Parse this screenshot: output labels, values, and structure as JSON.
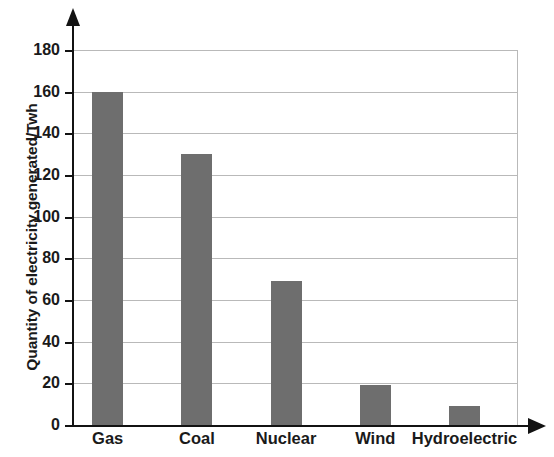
{
  "chart_data": {
    "type": "bar",
    "title": "",
    "subtitle": "",
    "xlabel": "",
    "ylabel": "Quantity of electricity generated/Twh",
    "categories": [
      "Gas",
      "Coal",
      "Nuclear",
      "Wind",
      "Hydroelectric"
    ],
    "values": [
      160,
      130,
      69,
      19,
      9
    ],
    "series": [
      {
        "name": "Quantity of electricity generated",
        "values": [
          160,
          130,
          69,
          19,
          9
        ]
      }
    ],
    "ylim": [
      0,
      180
    ],
    "xlim": [
      0,
      5
    ],
    "y_ticks": [
      0,
      20,
      40,
      60,
      80,
      100,
      120,
      140,
      160,
      180
    ],
    "y_tick_labels": [
      "0",
      "20",
      "40",
      "60",
      "80",
      "100",
      "120",
      "140",
      "160",
      "180"
    ],
    "grid": true,
    "grid_axis": "y",
    "legend": false,
    "legend_position": "none",
    "bar_color": "#6e6e6e",
    "gridline_color": "#b9b9b9",
    "axis_color": "#131313",
    "background_color": "#ffffff",
    "axis_arrows": true,
    "units": "Twh",
    "annotations": []
  }
}
